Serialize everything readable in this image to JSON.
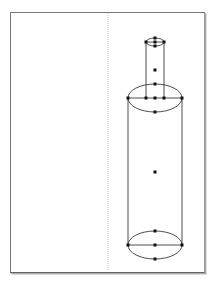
{
  "canvas": {
    "width": 213,
    "height": 302,
    "background": "#ffffff"
  },
  "page": {
    "border_color": "#777777"
  },
  "guide": {
    "x": 108,
    "color": "#cccccc",
    "style": "dotted"
  },
  "shape": {
    "name": "bottle-3d-primitive",
    "stroke": "#222222",
    "handle_color": "#111111",
    "neck": {
      "cx": 155,
      "top_y": 42,
      "bottom_y": 98,
      "rx": 9,
      "ry": 4
    },
    "body": {
      "cx": 155,
      "top_y": 98,
      "bottom_y": 245,
      "rx": 27,
      "ry": 14
    },
    "center_handle": {
      "x": 155,
      "y": 172
    },
    "neck_mid_handle": {
      "x": 155,
      "y": 70
    }
  }
}
